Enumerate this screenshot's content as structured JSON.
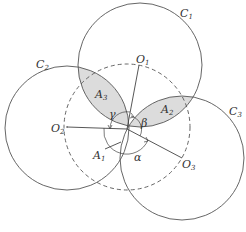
{
  "diagram": {
    "circles": [
      {
        "label": "C",
        "sub": "1",
        "center_label": "O",
        "center_sub": "1"
      },
      {
        "label": "C",
        "sub": "2",
        "center_label": "O",
        "center_sub": "2"
      },
      {
        "label": "C",
        "sub": "3",
        "center_label": "O",
        "center_sub": "3"
      }
    ],
    "regions": [
      {
        "label": "A",
        "sub": "1"
      },
      {
        "label": "A",
        "sub": "2"
      },
      {
        "label": "A",
        "sub": "3"
      }
    ],
    "angles": {
      "alpha": "α",
      "beta": "β",
      "gamma": "γ"
    },
    "colors": {
      "stroke": "#555555",
      "shaded": "#dcdcdc"
    }
  }
}
